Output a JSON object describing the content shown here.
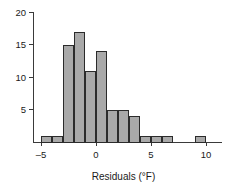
{
  "chart_data": {
    "type": "bar",
    "title": "",
    "subtitle": "",
    "xlabel": "Residuals (°F)",
    "ylabel": "",
    "xlim": [
      -6,
      11
    ],
    "ylim": [
      0,
      20
    ],
    "grid": false,
    "legend": null,
    "bin_width": 1,
    "bar_color": "#a9a9a9",
    "bar_edge_color": "#2b2b2b",
    "axis_color": "#3a3a3a",
    "x_ticks": [
      {
        "value": -5,
        "label": "–5"
      },
      {
        "value": 0,
        "label": "0"
      },
      {
        "value": 5,
        "label": "5"
      },
      {
        "value": 10,
        "label": "10"
      }
    ],
    "y_ticks": [
      {
        "value": 5,
        "label": "5"
      },
      {
        "value": 10,
        "label": "10"
      },
      {
        "value": 15,
        "label": "15"
      },
      {
        "value": 20,
        "label": "20"
      }
    ],
    "categories": [
      "-5 to -4",
      "-4 to -3",
      "-3 to -2",
      "-2 to -1",
      "-1 to 0",
      "0 to 1",
      "1 to 2",
      "2 to 3",
      "3 to 4",
      "4 to 5",
      "5 to 6",
      "6 to 7",
      "9 to 10"
    ],
    "bins": [
      {
        "x0": -5,
        "x1": -4,
        "count": 1
      },
      {
        "x0": -4,
        "x1": -3,
        "count": 1
      },
      {
        "x0": -3,
        "x1": -2,
        "count": 15
      },
      {
        "x0": -2,
        "x1": -1,
        "count": 17
      },
      {
        "x0": -1,
        "x1": 0,
        "count": 11
      },
      {
        "x0": 0,
        "x1": 1,
        "count": 14
      },
      {
        "x0": 1,
        "x1": 2,
        "count": 5
      },
      {
        "x0": 2,
        "x1": 3,
        "count": 5
      },
      {
        "x0": 3,
        "x1": 4,
        "count": 4
      },
      {
        "x0": 4,
        "x1": 5,
        "count": 1
      },
      {
        "x0": 5,
        "x1": 6,
        "count": 1
      },
      {
        "x0": 6,
        "x1": 7,
        "count": 1
      },
      {
        "x0": 9,
        "x1": 10,
        "count": 1
      }
    ],
    "values": [
      1,
      1,
      15,
      17,
      11,
      14,
      5,
      5,
      4,
      1,
      1,
      1,
      1
    ]
  }
}
